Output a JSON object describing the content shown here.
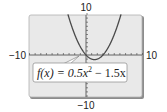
{
  "chart_data": {
    "type": "line",
    "title": "",
    "function": "f(x) = 0.5x^2 - 1.5x",
    "coefficients": {
      "a": 0.5,
      "b": -1.5,
      "c": 0
    },
    "xlim": [
      -10,
      10
    ],
    "ylim": [
      -10,
      10
    ],
    "xscale": 1,
    "yscale": 1,
    "grid": false,
    "series": [
      {
        "name": "f(x) = 0.5x² − 1.5x",
        "x": [
          -3.2,
          -3,
          -2,
          -1,
          0,
          1,
          1.5,
          2,
          3,
          4,
          5,
          6,
          6.2
        ],
        "values": [
          9.92,
          9,
          5,
          2,
          0,
          -1,
          -1.125,
          -1,
          0,
          2,
          5,
          9,
          9.92
        ]
      }
    ],
    "tick_labels": {
      "x_min": "−10",
      "x_max": "10",
      "y_min": "−10",
      "y_max": "10"
    },
    "annotation": {
      "label_prefix": "f(x) = 0.5x",
      "label_exp": "2",
      "label_suffix": " − 1.5x"
    }
  },
  "colors": {
    "screen_bg": "#e9e9e9",
    "screen_border": "#9a9a9a",
    "curve": "#4a4a4a",
    "axis": "#555555",
    "label_bg": "#ffffff"
  }
}
